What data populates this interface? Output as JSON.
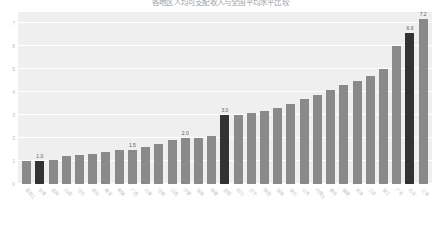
{
  "chart_data": {
    "type": "bar",
    "title": "各地区人均可支配收入与全国平均水平比较",
    "xlabel": "",
    "ylabel": "",
    "ylim": [
      0,
      7.5
    ],
    "yticks": [
      0,
      1,
      2,
      3,
      4,
      5,
      6,
      7
    ],
    "grid": true,
    "legend": "none",
    "bar_color": "#8a8a8a",
    "highlight_color": "#333333",
    "plot_background": "#efefef",
    "gridline_color": "#ffffff",
    "categories": [
      "黑龙江",
      "甘肃",
      "吉林",
      "山西",
      "河北",
      "贵州",
      "青海",
      "新疆",
      "广西",
      "云南",
      "河南",
      "江西",
      "宁夏",
      "海南",
      "安徽",
      "全国",
      "四川",
      "辽宁",
      "陕西",
      "湖南",
      "湖北",
      "山东",
      "内蒙古",
      "重庆",
      "福建",
      "天津",
      "江苏",
      "浙江",
      "广东",
      "北京",
      "上海"
    ],
    "values": [
      1.0,
      1.0,
      1.05,
      1.2,
      1.25,
      1.3,
      1.4,
      1.5,
      1.5,
      1.6,
      1.75,
      1.9,
      2.0,
      2.0,
      2.1,
      3.0,
      3.0,
      3.1,
      3.2,
      3.3,
      3.5,
      3.7,
      3.9,
      4.1,
      4.3,
      4.5,
      4.7,
      5.0,
      6.0,
      6.6,
      7.2
    ],
    "highlighted_indices": [
      1,
      15,
      29
    ],
    "labels": [
      {
        "index": 1,
        "text": "1.0"
      },
      {
        "index": 8,
        "text": "1.5"
      },
      {
        "index": 12,
        "text": "2.0"
      },
      {
        "index": 15,
        "text": "3.0"
      },
      {
        "index": 29,
        "text": "6.6"
      },
      {
        "index": 30,
        "text": "7.2"
      }
    ]
  }
}
